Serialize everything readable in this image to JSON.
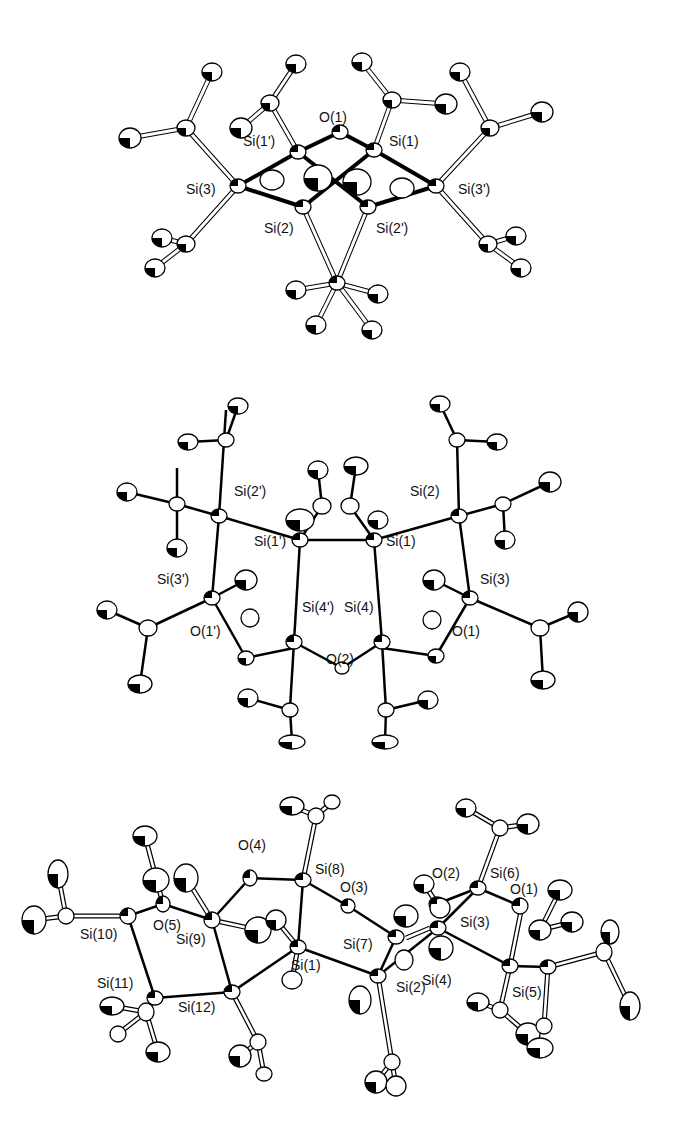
{
  "figure": {
    "panels": [
      {
        "id": "top",
        "labels": [
          "O(1)",
          "Si(1')",
          "Si(1)",
          "Si(3)",
          "Si(3')",
          "Si(2)",
          "Si(2')"
        ]
      },
      {
        "id": "middle",
        "labels": [
          "Si(2')",
          "Si(2)",
          "Si(1')",
          "Si(1)",
          "Si(3')",
          "Si(3)",
          "Si(4')",
          "Si(4)",
          "O(1')",
          "O(1)",
          "O(2)"
        ]
      },
      {
        "id": "bottom",
        "labels": [
          "O(4)",
          "Si(8)",
          "O(3)",
          "O(2)",
          "Si(6)",
          "O(1)",
          "Si(10)",
          "O(5)",
          "Si(9)",
          "Si(7)",
          "Si(3)",
          "Si(1)",
          "Si(11)",
          "Si(12)",
          "Si(2)",
          "Si(4)",
          "Si(5)"
        ]
      }
    ]
  }
}
